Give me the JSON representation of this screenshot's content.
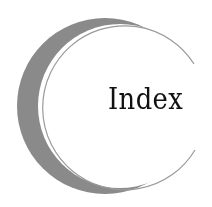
{
  "title": "Index",
  "colors": {
    "background": "#ffffff",
    "crescent": "#8a8a8a",
    "outline": "#9a9a9a",
    "text": "#111111"
  }
}
